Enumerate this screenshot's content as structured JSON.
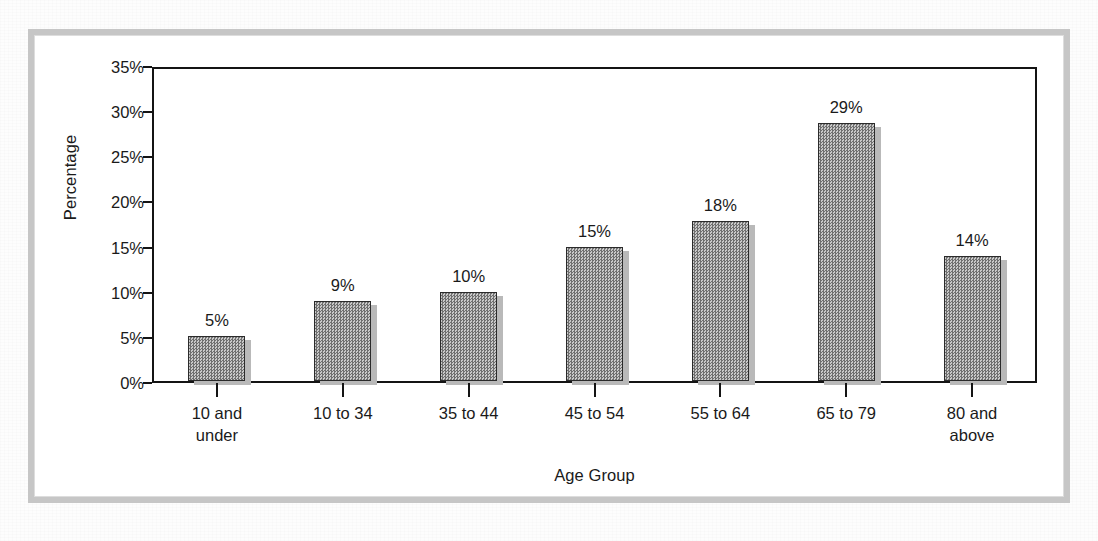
{
  "chart_data": {
    "type": "bar",
    "title": "",
    "xlabel": "Age Group",
    "ylabel": "Percentage",
    "categories": [
      "10 and under",
      "10 to 34",
      "35 to 44",
      "45 to 54",
      "55 to 64",
      "65 to 79",
      "80 and above"
    ],
    "category_lines": [
      [
        "10 and",
        "under"
      ],
      [
        "10 to 34"
      ],
      [
        "35 to 44"
      ],
      [
        "45 to 54"
      ],
      [
        "55 to 64"
      ],
      [
        "65 to 79"
      ],
      [
        "80 and",
        "above"
      ]
    ],
    "values": [
      5,
      9,
      10,
      15,
      18,
      29,
      14
    ],
    "value_labels": [
      "5%",
      "9%",
      "10%",
      "15%",
      "18%",
      "29%",
      "14%"
    ],
    "ylim": [
      0,
      35
    ],
    "ytick_values": [
      0,
      5,
      10,
      15,
      20,
      25,
      30,
      35
    ],
    "ytick_labels": [
      "0%",
      "5%",
      "10%",
      "15%",
      "20%",
      "25%",
      "30%",
      "35%"
    ],
    "grid": false,
    "legend": false,
    "legend_position": "none",
    "bar_fill_color": "#9b9b9b",
    "bar_edge_color": "#2b2b2b",
    "bar_shadow_color": "#b9b9b9",
    "axis_color": "#141414",
    "text_color": "#1a1a1a",
    "frame_color": "#c6c6c6",
    "background_color": "#ffffff"
  }
}
